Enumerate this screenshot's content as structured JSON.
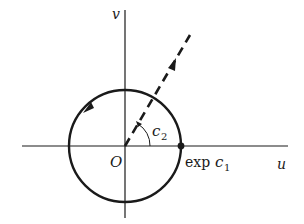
{
  "diagram": {
    "axes": {
      "horizontal_label": "u",
      "vertical_label": "v",
      "origin_label": "O"
    },
    "circle": {
      "point_label_prefix": "exp ",
      "point_label_var": "c",
      "point_label_sub": "1",
      "direction": "counterclockwise"
    },
    "ray": {
      "angle_label_var": "c",
      "angle_label_sub": "2",
      "style": "dashed"
    },
    "colors": {
      "ink": "#1a1a1a",
      "background": "#ffffff"
    }
  }
}
